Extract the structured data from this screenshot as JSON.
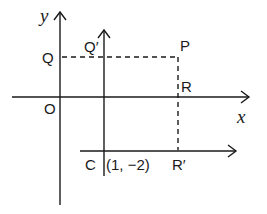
{
  "diagram": {
    "type": "coordinate-axes-shift-of-origin",
    "original_axes": {
      "x_label": "x",
      "y_label": "y",
      "origin_label": "O"
    },
    "points": {
      "P": "P",
      "Q": "Q",
      "Q_prime": "Q′",
      "R": "R",
      "R_prime": "R′",
      "C": "C"
    },
    "new_origin_coords": "(1, −2)",
    "colors": {
      "ink": "#1a1a1a",
      "background": "#ffffff"
    }
  }
}
